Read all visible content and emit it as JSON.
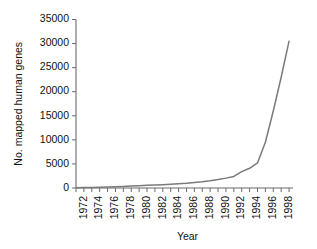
{
  "chart_data": {
    "type": "line",
    "title": "",
    "xlabel": "Year",
    "ylabel": "No. mapped human genes",
    "xlim": [
      1971,
      1998.5
    ],
    "ylim": [
      0,
      35000
    ],
    "grid": false,
    "legend": null,
    "line_color": "#7a7a7a",
    "axis_color": "#6b6b6b",
    "ytick_labels": [
      "0",
      "5000",
      "10000",
      "15000",
      "20000",
      "25000",
      "30000",
      "35000"
    ],
    "ytick_values": [
      0,
      5000,
      10000,
      15000,
      20000,
      25000,
      30000,
      35000
    ],
    "xtick_labels": [
      "1972",
      "1974",
      "1976",
      "1978",
      "1980",
      "1982",
      "1984",
      "1986",
      "1988",
      "1990",
      "1992",
      "1994",
      "1996",
      "1998"
    ],
    "xtick_values": [
      1972,
      1974,
      1976,
      1978,
      1980,
      1982,
      1984,
      1986,
      1988,
      1990,
      1992,
      1994,
      1996,
      1998
    ],
    "minor_xtick_values": [
      1971,
      1973,
      1975,
      1977,
      1979,
      1981,
      1983,
      1985,
      1987,
      1989,
      1991,
      1993,
      1995,
      1997
    ],
    "x": [
      1971,
      1972,
      1973,
      1974,
      1975,
      1976,
      1977,
      1978,
      1979,
      1980,
      1981,
      1982,
      1983,
      1984,
      1985,
      1986,
      1987,
      1988,
      1989,
      1990,
      1991,
      1992,
      1993,
      1994,
      1995,
      1996,
      1997,
      1998
    ],
    "values": [
      60,
      80,
      110,
      150,
      200,
      260,
      330,
      400,
      470,
      550,
      620,
      700,
      800,
      900,
      1000,
      1150,
      1300,
      1500,
      1750,
      2050,
      2400,
      3400,
      4100,
      5200,
      9500,
      16000,
      23000,
      30500
    ]
  },
  "axes": {
    "y_title": "No. mapped human genes",
    "x_title": "Year"
  }
}
